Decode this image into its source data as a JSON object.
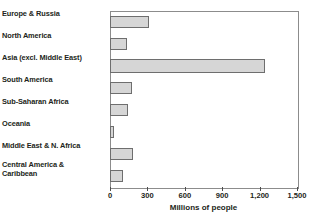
{
  "chart_data": {
    "type": "bar",
    "orientation": "horizontal",
    "title": "",
    "xlabel": "Millions of people",
    "ylabel": "",
    "xlim": [
      0,
      1500
    ],
    "xticks": [
      0,
      300,
      600,
      900,
      1200,
      1500
    ],
    "xtick_labels": [
      "0",
      "300",
      "600",
      "900",
      "1,200",
      "1,500"
    ],
    "grid": false,
    "legend": "none",
    "categories": [
      "Europe & Russia",
      "North America",
      "Asia (excl. Middle East)",
      "South America",
      "Sub-Saharan Africa",
      "Oceania",
      "Middle East & N. Africa",
      "Central America &\nCaribbean"
    ],
    "values": [
      313,
      136,
      1243,
      176,
      144,
      32,
      185,
      104
    ],
    "bar_fill_color": "#d6d6d6",
    "bar_border_color": "#6e6e6e",
    "frame_color": "#8c8c8c"
  }
}
